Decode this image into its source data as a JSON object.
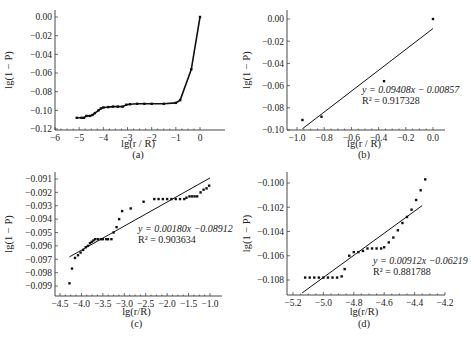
{
  "chart_data": [
    {
      "panel": "(a)",
      "type": "line",
      "xlabel": "lg(r / R)",
      "ylabel": "lg(1 − P)",
      "xlim": [
        -6,
        0.5
      ],
      "ylim": [
        -0.12,
        0.01
      ],
      "xticks": [
        "−6",
        "−5",
        "−4",
        "−3",
        "−2",
        "−1",
        "0"
      ],
      "yticks": [
        "0.00",
        "−0.02",
        "−0.04",
        "−0.06",
        "−0.08",
        "−0.10",
        "−0.12"
      ],
      "x": [
        -5.1,
        -4.9,
        -4.8,
        -4.7,
        -4.55,
        -4.45,
        -4.35,
        -4.2,
        -4.1,
        -4.0,
        -3.8,
        -3.6,
        -3.4,
        -3.2,
        -3.05,
        -2.9,
        -2.6,
        -2.3,
        -2.0,
        -1.5,
        -1.0,
        -0.82,
        -0.36,
        0.0
      ],
      "y": [
        -0.108,
        -0.108,
        -0.108,
        -0.106,
        -0.106,
        -0.105,
        -0.103,
        -0.1,
        -0.098,
        -0.097,
        -0.0965,
        -0.096,
        -0.096,
        -0.096,
        -0.094,
        -0.0935,
        -0.093,
        -0.093,
        -0.093,
        -0.093,
        -0.092,
        -0.089,
        -0.056,
        0.0
      ]
    },
    {
      "panel": "(b)",
      "type": "scatter",
      "xlabel": "lg(r / R)",
      "ylabel": "lg(1 − P)",
      "xlim": [
        -1.08,
        0.1
      ],
      "ylim": [
        -0.1,
        0.01
      ],
      "xticks": [
        "−1.0",
        "−0.8",
        "−0.6",
        "−0.4",
        "−0.2",
        "0.0"
      ],
      "yticks": [
        "0.00",
        "−0.02",
        "−0.04",
        "−0.06",
        "−0.08",
        "−0.10"
      ],
      "x": [
        -0.96,
        -0.82,
        -0.36,
        0.0
      ],
      "y": [
        -0.091,
        -0.088,
        -0.056,
        0.0
      ],
      "fit": {
        "slope": 0.09408,
        "intercept": -0.00857,
        "x_range": [
          -0.96,
          0.0
        ]
      },
      "annotation": [
        "y = 0.09408x − 0.00857",
        "R² = 0.917328"
      ]
    },
    {
      "panel": "(c)",
      "type": "scatter",
      "xlabel": "lg(r/R)",
      "ylabel": "lg(1 − P)",
      "xlim": [
        -4.6,
        -0.9
      ],
      "ylim": [
        -0.0993,
        -0.0905
      ],
      "xticks": [
        "−4.5",
        "−4.0",
        "−3.5",
        "−3.0",
        "−2.5",
        "−2.0",
        "−1.5",
        "−1.0"
      ],
      "yticks": [
        "−0.091",
        "−0.092",
        "−0.093",
        "−0.094",
        "−0.095",
        "−0.096",
        "−0.097",
        "−0.098",
        "−0.099"
      ],
      "x": [
        -4.28,
        -4.22,
        -4.15,
        -4.08,
        -4.02,
        -3.96,
        -3.9,
        -3.85,
        -3.8,
        -3.76,
        -3.72,
        -3.68,
        -3.62,
        -3.55,
        -3.5,
        -3.42,
        -3.38,
        -3.3,
        -3.25,
        -3.18,
        -3.12,
        -3.05,
        -2.85,
        -2.55,
        -2.3,
        -2.2,
        -2.1,
        -2.0,
        -1.9,
        -1.8,
        -1.7,
        -1.6,
        -1.55,
        -1.48,
        -1.42,
        -1.36,
        -1.3,
        -1.22,
        -1.15,
        -1.08,
        -1.02
      ],
      "y": [
        -0.0988,
        -0.0977,
        -0.0969,
        -0.0967,
        -0.0965,
        -0.0963,
        -0.0961,
        -0.096,
        -0.0958,
        -0.0957,
        -0.0956,
        -0.0955,
        -0.0955,
        -0.0955,
        -0.0955,
        -0.0955,
        -0.0955,
        -0.0955,
        -0.095,
        -0.0946,
        -0.094,
        -0.0934,
        -0.0932,
        -0.0927,
        -0.0925,
        -0.0925,
        -0.0925,
        -0.0925,
        -0.0925,
        -0.0925,
        -0.0925,
        -0.0925,
        -0.0924,
        -0.0923,
        -0.0923,
        -0.0923,
        -0.0923,
        -0.092,
        -0.0918,
        -0.0917,
        -0.0915
      ],
      "fit": {
        "slope": 0.0018,
        "intercept": -0.08912,
        "x_range": [
          -4.28,
          -1.0
        ]
      },
      "annotation": [
        "y = 0.00180x −0.08912",
        "R² = 0.903634"
      ]
    },
    {
      "panel": "(d)",
      "type": "scatter",
      "xlabel": "lg(r/R)",
      "ylabel": "lg(1 − P)",
      "xlim": [
        -5.3,
        -4.2
      ],
      "ylim": [
        -0.109,
        -0.0993
      ],
      "xticks": [
        "−5.2",
        "−5.0",
        "−4.8",
        "−4.6",
        "−4.4",
        "−4.2"
      ],
      "yticks": [
        "−0.100",
        "−0.102",
        "−0.104",
        "−0.106",
        "−0.108"
      ],
      "x": [
        -5.12,
        -5.09,
        -5.06,
        -5.03,
        -5.0,
        -4.97,
        -4.94,
        -4.91,
        -4.88,
        -4.86,
        -4.83,
        -4.8,
        -4.77,
        -4.74,
        -4.71,
        -4.68,
        -4.65,
        -4.62,
        -4.6,
        -4.57,
        -4.54,
        -4.51,
        -4.48,
        -4.45,
        -4.42,
        -4.39,
        -4.36,
        -4.33
      ],
      "y": [
        -0.1078,
        -0.1078,
        -0.1078,
        -0.1078,
        -0.1078,
        -0.1078,
        -0.1078,
        -0.1078,
        -0.1077,
        -0.1071,
        -0.106,
        -0.1057,
        -0.1057,
        -0.1056,
        -0.1054,
        -0.1054,
        -0.1054,
        -0.1054,
        -0.1053,
        -0.1049,
        -0.1045,
        -0.1039,
        -0.1033,
        -0.1028,
        -0.1022,
        -0.1014,
        -0.1006,
        -0.0997
      ],
      "fit": {
        "slope": 0.00912,
        "intercept": -0.06219,
        "x_range": [
          -5.14,
          -4.35
        ]
      },
      "annotation": [
        "y = 0.00912x −0.06219",
        "R² = 0.881788"
      ]
    }
  ],
  "captions": [
    "(a)",
    "(b)",
    "(c)",
    "(d)"
  ]
}
